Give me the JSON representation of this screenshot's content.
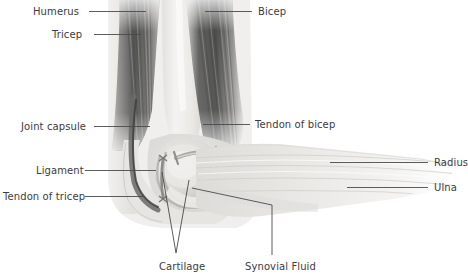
{
  "diagram": {
    "background_color": "#ffffff",
    "label_color": "#3c3c3c",
    "leader_line_color": "#4a4a4a",
    "muscle_dark_color": "#4d4d4d",
    "bone_light_color": "#efeeec",
    "tissue_mid_color": "#d9d8d4",
    "labels": [
      {
        "id": "humerus",
        "text": "Humerus",
        "side": "left",
        "text_x": 33,
        "text_y": 6,
        "line": [
          [
            89,
            11
          ],
          [
            146,
            11
          ]
        ]
      },
      {
        "id": "tricep",
        "text": "Tricep",
        "side": "left",
        "text_x": 52,
        "text_y": 29,
        "line": [
          [
            94,
            34
          ],
          [
            141,
            34
          ]
        ]
      },
      {
        "id": "joint-capsule",
        "text": "Joint capsule",
        "side": "left",
        "text_x": 21,
        "text_y": 121,
        "line": [
          [
            94,
            126
          ],
          [
            150,
            126
          ]
        ]
      },
      {
        "id": "ligament",
        "text": "Ligament",
        "side": "left",
        "text_x": 36,
        "text_y": 165,
        "line": [
          [
            85,
            170
          ],
          [
            156,
            170
          ]
        ]
      },
      {
        "id": "tendon-of-tricep",
        "text": "Tendon of tricep",
        "side": "left",
        "text_x": 3,
        "text_y": 191,
        "line": [
          [
            85,
            196
          ],
          [
            145,
            196
          ]
        ]
      },
      {
        "id": "bicep",
        "text": "Bicep",
        "side": "right",
        "text_x": 258,
        "text_y": 6,
        "line": [
          [
            205,
            11
          ],
          [
            252,
            11
          ]
        ]
      },
      {
        "id": "tendon-of-bicep",
        "text": "Tendon of bicep",
        "side": "right",
        "text_x": 255,
        "text_y": 119,
        "line": [
          [
            203,
            124
          ],
          [
            250,
            124
          ]
        ]
      },
      {
        "id": "radius",
        "text": "Radius",
        "side": "right",
        "text_x": 434,
        "text_y": 157,
        "line": [
          [
            330,
            162
          ],
          [
            428,
            162
          ]
        ]
      },
      {
        "id": "ulna",
        "text": "Ulna",
        "side": "right",
        "text_x": 434,
        "text_y": 182,
        "line": [
          [
            347,
            187
          ],
          [
            428,
            187
          ]
        ]
      },
      {
        "id": "cartilage",
        "text": "Cartilage",
        "side": "bottom",
        "text_x": 159,
        "text_y": 261,
        "line_a": [
          [
            162,
            172
          ],
          [
            176,
            253
          ]
        ],
        "line_b": [
          [
            189,
            180
          ],
          [
            176,
            253
          ]
        ]
      },
      {
        "id": "synovial-fluid",
        "text": "Synovial Fluid",
        "side": "bottom",
        "text_x": 245,
        "text_y": 261,
        "line": [
          [
            192,
            188
          ],
          [
            272,
            205
          ],
          [
            272,
            255
          ]
        ]
      }
    ]
  }
}
